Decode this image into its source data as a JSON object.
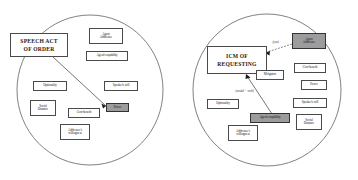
{
  "figure": {
    "type": "diagram",
    "panel_count": 2,
    "colors": {
      "shaded_box_fill": "#9c9c9c",
      "box_fill": "#ffffff",
      "stroke": "#4a4a4a",
      "text": "#1a1a1a",
      "background": "#ffffff"
    }
  },
  "panels": [
    {
      "id": "left",
      "name": "speech-act-of-order-panel",
      "central_node": {
        "label_line1": "SPEECH ACT",
        "label_line2": "OF ORDER",
        "shaded": false
      },
      "nodes": [
        {
          "id": "agent-addressee",
          "label": "Agent\nAddressee",
          "shaded": false
        },
        {
          "id": "agents-capability",
          "label": "Agent's capability",
          "shaded": false
        },
        {
          "id": "speakers-will",
          "label": "Speaker's will",
          "shaded": false
        },
        {
          "id": "optionality",
          "label": "Optionality",
          "shaded": false
        },
        {
          "id": "social-distance",
          "label": "Social\nDistance",
          "shaded": false
        },
        {
          "id": "cost-benefit",
          "label": "Cost-benefit",
          "shaded": false
        },
        {
          "id": "addressees-willingness",
          "label": "Addressee's\nwillingness",
          "shaded": false
        },
        {
          "id": "power",
          "label": "Power",
          "shaded": true
        }
      ],
      "edges": [
        {
          "from": "central",
          "to": "power",
          "label": ""
        }
      ]
    },
    {
      "id": "right",
      "name": "icm-of-requesting-panel",
      "central_node": {
        "label_line1": "ICM OF",
        "label_line2": "REQUESTING",
        "shaded": false
      },
      "nodes": [
        {
          "id": "agent-addressee",
          "label": "Agent\nAddressee",
          "shaded": true
        },
        {
          "id": "mitigators",
          "label": "Mitigators",
          "shaded": false
        },
        {
          "id": "cost-benefit",
          "label": "Cost-benefit",
          "shaded": false
        },
        {
          "id": "power",
          "label": "Power",
          "shaded": false
        },
        {
          "id": "speakers-will",
          "label": "Speaker's will",
          "shaded": false
        },
        {
          "id": "social-distance",
          "label": "Social\nDistance",
          "shaded": false
        },
        {
          "id": "optionality",
          "label": "Optionality",
          "shaded": false
        },
        {
          "id": "agents-capability",
          "label": "Agent's capability",
          "shaded": true
        },
        {
          "id": "addressees-willingness",
          "label": "Addressee's\nwillingness",
          "shaded": false
        }
      ],
      "edges": [
        {
          "from": "agent-addressee",
          "to": "central",
          "label": "(you)"
        },
        {
          "from": "agents-capability",
          "to": "central",
          "label": "(modal + verb)"
        }
      ]
    }
  ]
}
